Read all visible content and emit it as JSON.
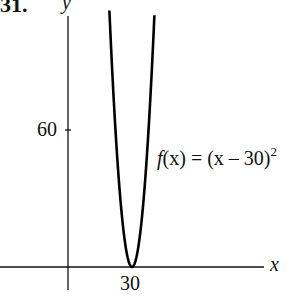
{
  "problem_number": "31.",
  "chart_data": {
    "type": "line",
    "title": "",
    "function": "f(x) = (x - 30)^2",
    "xlabel": "x",
    "ylabel": "y",
    "x_ticks": [
      30
    ],
    "y_ticks": [
      60
    ],
    "grid": false,
    "vertex": {
      "x": 30,
      "y": 0
    },
    "x": [
      19.5,
      22,
      25,
      27,
      29,
      30,
      31,
      33,
      35,
      38,
      40.5
    ],
    "y": [
      110.25,
      64,
      25,
      9,
      1,
      0,
      1,
      9,
      25,
      64,
      110.25
    ],
    "xlim": [
      -32,
      66
    ],
    "ylim": [
      -10,
      115
    ],
    "annotations": [
      {
        "text": "f(x) = (x – 30)²",
        "x": 42,
        "y": 53
      }
    ]
  },
  "labels": {
    "x_axis": "x",
    "y_axis": "y",
    "tick_x": "30",
    "tick_y": "60",
    "func_f": "f",
    "func_mid": "(x) = (x – 30)",
    "func_exp": "2"
  }
}
